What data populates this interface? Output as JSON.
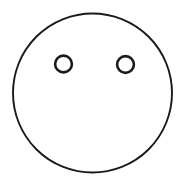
{
  "canvas": {
    "width": 186,
    "height": 186,
    "background_color": "#ffffff",
    "alt_text": "Simple line drawing of a face: a large open circle containing two small open circles as eyes, with no nose or mouth."
  },
  "drawing": {
    "title": "Face Outline",
    "stroke_color": "#1a1a1a",
    "fill_color": "none",
    "shapes": [
      {
        "id": "face-outline",
        "name": "face-outline-circle",
        "kind": "circle",
        "cx": 92.5,
        "cy": 93,
        "r": 79.5,
        "stroke_width": 1.9,
        "fill": "none"
      },
      {
        "id": "eye-left",
        "name": "left-eye-circle",
        "kind": "circle",
        "cx": 63.5,
        "cy": 64,
        "r": 8.4,
        "stroke_width": 2.6,
        "fill": "none"
      },
      {
        "id": "eye-right",
        "name": "right-eye-circle",
        "kind": "circle",
        "cx": 125.5,
        "cy": 64.5,
        "r": 8.4,
        "stroke_width": 2.6,
        "fill": "none"
      }
    ]
  }
}
